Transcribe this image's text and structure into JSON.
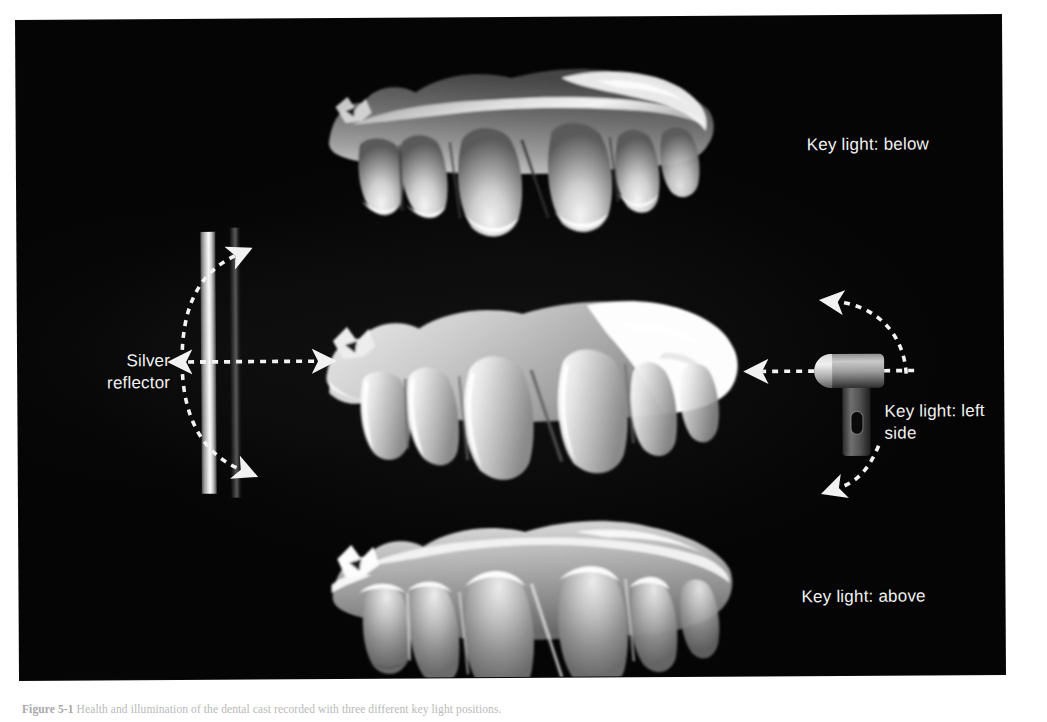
{
  "figure": {
    "caption_label": "Figure 5-1",
    "caption_text": "Health and illumination of the dental cast recorded with three different key light positions."
  },
  "plate": {
    "background_color": "#050505",
    "labels": {
      "key_light_below": "Key light: below",
      "key_light_left_side": "Key light: left side",
      "key_light_above": "Key light: above",
      "silver_reflector": "Silver\nreflector"
    }
  },
  "diagrams": {
    "silver_reflector": {
      "name": "silver-reflector",
      "panel_color": "#fafafa",
      "arrows": [
        {
          "name": "reflector-arrow-right",
          "direction": "right"
        },
        {
          "name": "reflector-arrow-left",
          "direction": "left"
        },
        {
          "name": "reflector-arrow-up",
          "direction": "up-right"
        },
        {
          "name": "reflector-arrow-down",
          "direction": "down-right"
        }
      ]
    },
    "key_light": {
      "name": "key-light-flash-head",
      "body_color": "#c9c9c9",
      "arrows": [
        {
          "name": "keylight-arrow-left",
          "direction": "left"
        },
        {
          "name": "keylight-arrow-up",
          "direction": "up-left"
        },
        {
          "name": "keylight-arrow-down",
          "direction": "down-left"
        }
      ]
    }
  },
  "specimens": [
    {
      "name": "dental-cast-key-light-below",
      "lighting": "Key light: below",
      "description": "Maxillary dental cast, lateral view, illuminated from below"
    },
    {
      "name": "dental-cast-key-light-left-side",
      "lighting": "Key light: left side",
      "description": "Maxillary dental cast, lateral view, illuminated from the left side"
    },
    {
      "name": "dental-cast-key-light-above",
      "lighting": "Key light: above",
      "description": "Maxillary dental cast, lateral view, illuminated from above"
    }
  ]
}
